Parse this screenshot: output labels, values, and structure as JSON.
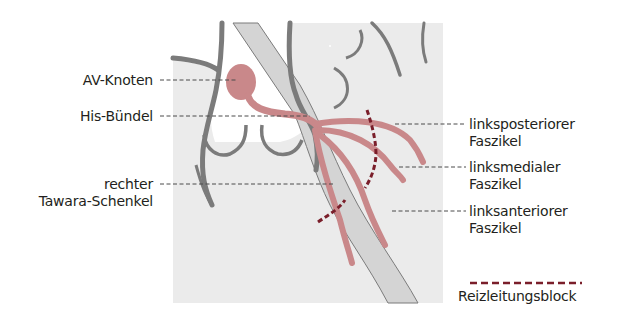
{
  "figure": {
    "colors": {
      "background_panel": "#ebebeb",
      "wall_stroke": "#7b7b7b",
      "septum_fill": "#cfcfcf",
      "conduction_pink": "#c9888a",
      "block_dash": "#7a1e2a",
      "leader_line": "#4a4a4a",
      "text": "#231f20"
    },
    "labels_left": [
      {
        "id": "av-knoten",
        "line1": "AV-Knoten",
        "line2": ""
      },
      {
        "id": "his-buendel",
        "line1": "His-Bündel",
        "line2": ""
      },
      {
        "id": "rechter-tawara-schenkel",
        "line1": "rechter",
        "line2": "Tawara-Schenkel"
      }
    ],
    "labels_right": [
      {
        "id": "linksposteriorer-faszikel",
        "line1": "linksposteriorer",
        "line2": "Faszikel"
      },
      {
        "id": "linksmedialer-faszikel",
        "line1": "linksmedialer",
        "line2": "Faszikel"
      },
      {
        "id": "linksanteriorer-faszikel",
        "line1": "linksanteriorer",
        "line2": "Faszikel"
      }
    ],
    "legend": {
      "label": "Reizleitungsblock",
      "symbol": "dashed-line"
    }
  }
}
